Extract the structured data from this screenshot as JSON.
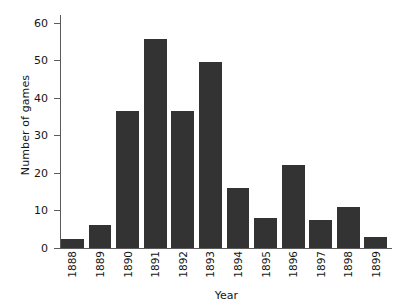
{
  "chart_data": {
    "type": "bar",
    "title": "",
    "xlabel": "Year",
    "ylabel": "Number of games",
    "categories": [
      "1888",
      "1889",
      "1890",
      "1891",
      "1892",
      "1893",
      "1894",
      "1895",
      "1896",
      "1897",
      "1898",
      "1899"
    ],
    "values": [
      2.5,
      6,
      36.5,
      55.5,
      36.5,
      49.5,
      16,
      8,
      22,
      7.5,
      11,
      3
    ],
    "ylim": [
      0,
      62
    ],
    "yticks": [
      0,
      10,
      20,
      30,
      40,
      50,
      60
    ],
    "ytick_labels": [
      "0",
      "10",
      "20",
      "30",
      "40",
      "50",
      "60"
    ],
    "grid": false,
    "legend": null,
    "bar_color": "#333333",
    "axis_color": "#5b5b5b",
    "background": "#ffffff"
  }
}
